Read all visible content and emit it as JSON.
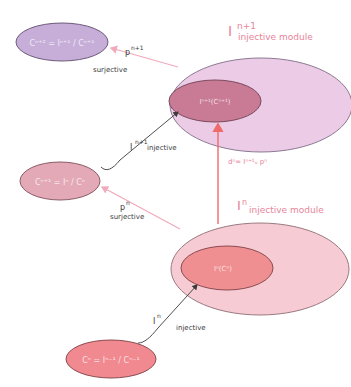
{
  "diagram": {
    "type": "injective resolution / cokernel construction",
    "colors": {
      "purple_light": "#eccbe6",
      "purple_inner": "#c97a95",
      "purple_small": "#c6aed8",
      "pink_light": "#f6cbd3",
      "pink_inner": "#ef8f92",
      "pink_mid": "#e3a9b6",
      "salmon": "#f08a90",
      "arrow_pink": "#f1a9bb",
      "arrow_red": "#ef6a6a",
      "arrow_dark": "#3a3a3a",
      "text_pink": "#e7849a"
    },
    "nodes": {
      "c_n_plus_2": {
        "label": "Cⁿ⁺² = Iⁿ⁺¹ / Cⁿ⁺¹"
      },
      "c_n_plus_1": {
        "label": "Cⁿ⁺¹ = Iⁿ / Cⁿ"
      },
      "c_n": {
        "label": "Cⁿ = Iⁿ⁻¹ / Cⁿ⁻¹"
      },
      "i_n_plus_1_module": {
        "title_base": "I",
        "title_sup": "n+1",
        "title_sub": "injective module",
        "inner_label": "Iⁿ⁺¹(Cⁿ⁺¹)"
      },
      "i_n_module": {
        "title_base": "I",
        "title_sup": "n",
        "title_sub": "injective module",
        "inner_label": "Iⁿ(Cⁿ)"
      }
    },
    "edges": {
      "p_n_plus_1": {
        "name": "p",
        "sup": "n+1",
        "kind": "surjective"
      },
      "i_n_plus_1": {
        "name": "I",
        "sup": "n+1",
        "kind": "injective"
      },
      "p_n": {
        "name": "p",
        "sup": "n",
        "kind": "surjective"
      },
      "i_n": {
        "name": "I",
        "sup": "n",
        "kind": "injective"
      },
      "d_n": {
        "label": "dⁿ= Iⁿ⁺¹ₒ pⁿ"
      }
    }
  }
}
